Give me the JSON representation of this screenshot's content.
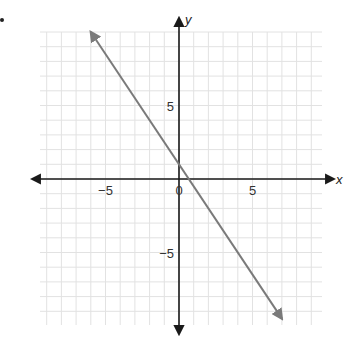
{
  "chart_data": {
    "type": "line",
    "title": "",
    "xlabel": "x",
    "ylabel": "y",
    "xlim": [
      -10,
      10
    ],
    "ylim": [
      -10,
      10
    ],
    "grid": true,
    "tick_labels": {
      "x": [
        {
          "value": -5,
          "label": "−5"
        },
        {
          "value": 0,
          "label": "0"
        },
        {
          "value": 5,
          "label": "5"
        }
      ],
      "y": [
        {
          "value": 5,
          "label": "5"
        },
        {
          "value": -5,
          "label": "−5"
        }
      ]
    },
    "series": [
      {
        "name": "line",
        "equation": "y = -1.5x + 1",
        "slope": -1.5,
        "intercept": 1,
        "x": [
          -6,
          7
        ],
        "y": [
          10,
          -9.5
        ],
        "arrows_both_ends": true,
        "color": "#7a7a7a"
      }
    ]
  },
  "colors": {
    "grid": "#e2e2e2",
    "axis": "#1a1a1a",
    "line": "#7a7a7a"
  }
}
